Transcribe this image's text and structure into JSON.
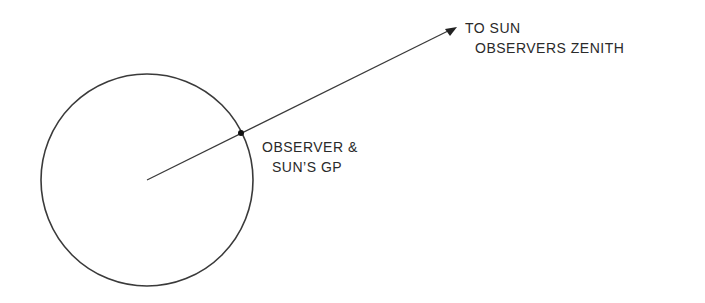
{
  "diagram": {
    "labels": {
      "to_sun": "TO SUN",
      "zenith": "OBSERVERS ZENITH",
      "observer_line1": "OBSERVER &",
      "observer_line2": "SUN’S GP"
    },
    "geometry": {
      "earth_center": [
        147,
        180
      ],
      "earth_radius": 106,
      "observer_point": [
        241,
        133
      ],
      "arrow_tip": [
        456,
        27
      ]
    },
    "colors": {
      "stroke": "#3a3a3a",
      "text": "#2a2a2a"
    }
  }
}
